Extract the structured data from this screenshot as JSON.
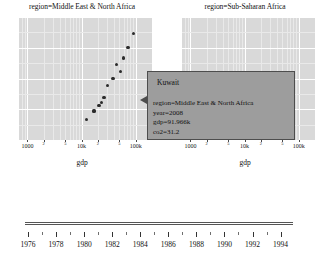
{
  "chart_data": {
    "type": "scatter",
    "title": "",
    "xlabel": "gdp",
    "ylabel": "co2",
    "xscale": "log",
    "grid": true,
    "legend": "none",
    "facet_variable": "region",
    "xlim": [
      700,
      200000
    ],
    "ylim": [
      0,
      36
    ],
    "xtick_labels": [
      "2",
      "5",
      "1000",
      "2",
      "5",
      "10k",
      "2",
      "5",
      "100k"
    ],
    "facets": [
      {
        "label": "region=Middle East & North Africa",
        "axis_label": "gdp",
        "points": [
          {
            "gdp": 12500,
            "co2": 6.0
          },
          {
            "gdp": 17000,
            "co2": 8.5
          },
          {
            "gdp": 21000,
            "co2": 10.0
          },
          {
            "gdp": 23500,
            "co2": 11.0
          },
          {
            "gdp": 26000,
            "co2": 12.5
          },
          {
            "gdp": 30000,
            "co2": 16.0
          },
          {
            "gdp": 38000,
            "co2": 18.0
          },
          {
            "gdp": 44000,
            "co2": 22.0
          },
          {
            "gdp": 52000,
            "co2": 20.0
          },
          {
            "gdp": 60000,
            "co2": 24.0
          },
          {
            "gdp": 72000,
            "co2": 27.0
          },
          {
            "gdp": 91966,
            "co2": 31.2
          }
        ]
      },
      {
        "label": "region=Sub-Saharan Africa",
        "axis_label": "gdp",
        "points": []
      }
    ],
    "highlighted_point": {
      "gdp": 91966,
      "co2": 31.2,
      "country": "Kuwait",
      "year": 2008
    }
  },
  "tooltip": {
    "title": "Kuwait",
    "rows": [
      "region=Middle East & North Africa",
      "year=2008",
      "gdp=91.966k",
      "co2=31.2"
    ]
  },
  "slider": {
    "year_labels": [
      "1976",
      "1978",
      "1980",
      "1982",
      "1984",
      "1986",
      "1988",
      "1990",
      "1992",
      "1994"
    ]
  },
  "colors": {
    "panel_fill": "#d9d9d9",
    "gridline": "#ffffff",
    "point": "#2b2b2b",
    "tooltip_fill": "#9d9d9d",
    "tooltip_border": "#4d4d4d",
    "text": "#111111",
    "page_background": "#ffffff"
  }
}
